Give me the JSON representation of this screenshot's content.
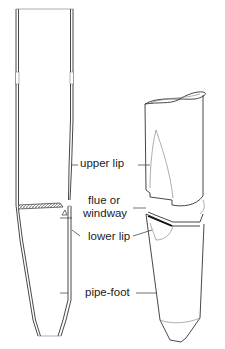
{
  "diagram": {
    "views": [
      "cross-section",
      "exterior perspective"
    ],
    "labels": {
      "upper_lip": "upper lip",
      "flue_line1": "flue or",
      "flue_line2": "windway",
      "lower_lip": "lower lip",
      "pipe_foot": "pipe-foot"
    },
    "colors": {
      "line": "#333333",
      "background": "#ffffff",
      "text": "#222222"
    }
  }
}
